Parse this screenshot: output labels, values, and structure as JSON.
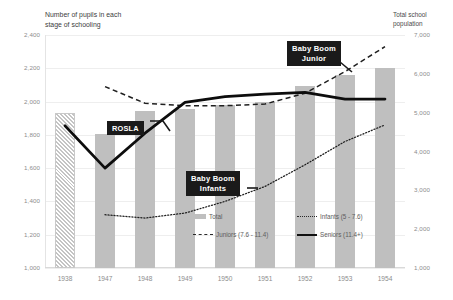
{
  "titles": {
    "left_axis_title": "Number of pupils in each\nstage of schooling",
    "right_axis_title": "Total school\npopulation"
  },
  "callouts": {
    "rosla": "ROSLA",
    "baby_boom_junior": "Baby Boom\nJunior",
    "baby_boom_infants": "Baby Boom\nInfants"
  },
  "legend": {
    "total": "Total",
    "infants": "Infants (5 - 7.6)",
    "juniors": "Juniors (7.6 - 11.4)",
    "seniors": "Seniors (11.4+)"
  },
  "axes": {
    "left_ticks": [
      "2,400",
      "2,200",
      "2,000",
      "1,800",
      "1,600",
      "1,400",
      "1,200",
      "1,000"
    ],
    "right_ticks": [
      "7,000",
      "6,000",
      "5,000",
      "4,000",
      "3,000",
      "2,000",
      "1,000"
    ],
    "x_ticks": [
      "1938",
      "1947",
      "1948",
      "1949",
      "1950",
      "1951",
      "1952",
      "1953",
      "1954"
    ]
  },
  "colors": {
    "bar_fill": "#bfbfbf",
    "line_dark": "#111111",
    "grid": "#eeeeee",
    "tick_text": "#8d8d8d",
    "callout_bg": "#1a1a1a"
  },
  "chart_data": {
    "type": "bar",
    "title": "Number of pupils in each stage of schooling",
    "subtitle": "Total school population",
    "xlabel": "",
    "ylabel": "Number of pupils in each stage of schooling",
    "y2label": "Total school population",
    "grid": true,
    "legend_position": "inside-bottom-right",
    "categories": [
      "1938",
      "1947",
      "1948",
      "1949",
      "1950",
      "1951",
      "1952",
      "1953",
      "1954"
    ],
    "ylim": [
      1000,
      2400
    ],
    "y2lim": [
      1000,
      7000
    ],
    "bars": {
      "name": "Total",
      "axis": "right",
      "values": [
        5000,
        4450,
        5050,
        5100,
        5200,
        5280,
        5680,
        5970,
        6150
      ],
      "estimated_index": 0,
      "estimated_note": "1938 bar drawn with diagonal hatch fill"
    },
    "series": [
      {
        "name": "Infants (5 - 7.6)",
        "axis": "left",
        "style": "dotted",
        "values": [
          null,
          1320,
          1300,
          1330,
          1400,
          1490,
          1620,
          1760,
          1860
        ]
      },
      {
        "name": "Juniors (7.6 - 11.4)",
        "axis": "left",
        "style": "dashed",
        "values": [
          null,
          2090,
          1990,
          1975,
          1975,
          1985,
          2050,
          2180,
          2330
        ]
      },
      {
        "name": "Seniors (11.4+)",
        "axis": "left",
        "style": "solid",
        "values": [
          1855,
          1600,
          1810,
          1995,
          2030,
          2045,
          2055,
          2015,
          2015
        ]
      }
    ],
    "annotations": [
      {
        "label": "ROSLA",
        "points_to": "1948 seniors rise"
      },
      {
        "label": "Baby Boom Junior",
        "points_to": "1953 juniors rise"
      },
      {
        "label": "Baby Boom Infants",
        "points_to": "1951 infants rise"
      }
    ]
  }
}
